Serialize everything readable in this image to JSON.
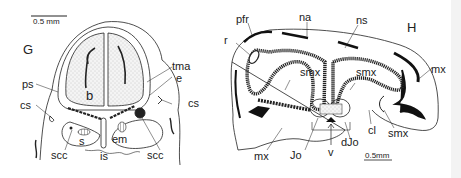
{
  "figure": {
    "panels": [
      {
        "id": "G",
        "label": "G",
        "scale_bar": "0.5 mm",
        "labels": {
          "ps": "ps",
          "cs_left": "cs",
          "cs_right": "cs",
          "b": "b",
          "tma": "tma",
          "e": "e",
          "s": "s",
          "is": "is",
          "em": "em",
          "scc_left": "scc",
          "scc_right": "scc"
        }
      },
      {
        "id": "H",
        "label": "H",
        "scale_bar": "0.5mm",
        "labels": {
          "pfr": "pfr",
          "na": "na",
          "ns": "ns",
          "r": "r",
          "smx_1": "smx",
          "smx_2": "smx",
          "smx_3": "smx",
          "mx_top": "mx",
          "mx_bottom": "mx",
          "jo": "Jo",
          "v": "v",
          "djo": "dJo",
          "cl": "cl"
        }
      }
    ],
    "colors": {
      "ink": "#1a1a1a",
      "stipple": "#d9d9d9",
      "background": "#ffffff"
    }
  }
}
